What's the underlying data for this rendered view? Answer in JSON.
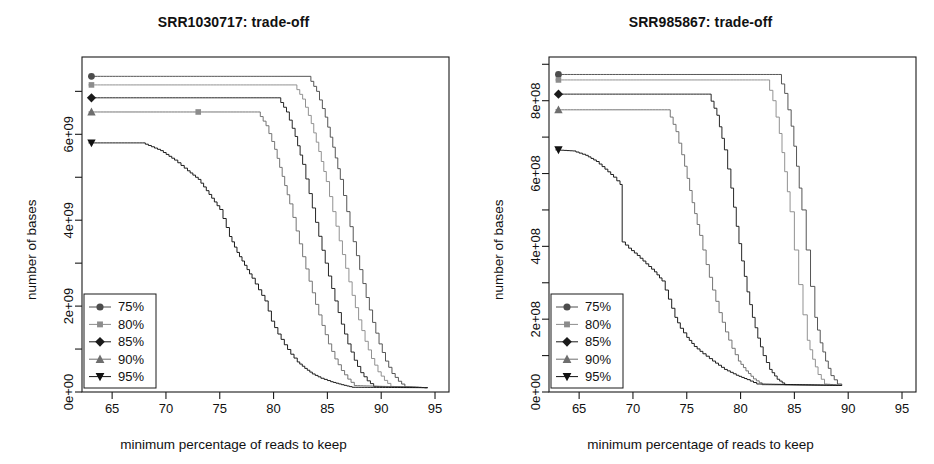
{
  "figure": {
    "width": 934,
    "height": 464,
    "background": "#ffffff",
    "line_color": "#3a3a3a",
    "axis_color": "#1a1a1a",
    "panel_count": 2
  },
  "axis_titles": {
    "x": "minimum percentage of reads to keep",
    "y": "number of bases"
  },
  "legend": {
    "entries": [
      {
        "label": "75%",
        "marker": "circle",
        "color": "#4d4d4d"
      },
      {
        "label": "80%",
        "marker": "square",
        "color": "#8c8c8c"
      },
      {
        "label": "85%",
        "marker": "diamond",
        "color": "#1a1a1a"
      },
      {
        "label": "90%",
        "marker": "triangle-up",
        "color": "#6e6e6e"
      },
      {
        "label": "95%",
        "marker": "triangle-down",
        "color": "#111111"
      }
    ]
  },
  "chart_data": [
    {
      "type": "line",
      "title": "SRR1030717: trade-off",
      "xlabel": "minimum percentage of reads to keep",
      "ylabel": "number of bases",
      "xlim": [
        62.2,
        96.3
      ],
      "ylim": [
        0,
        7800000000
      ],
      "xticks": [
        65,
        70,
        75,
        80,
        85,
        90,
        95
      ],
      "xtick_labels": [
        "65",
        "70",
        "75",
        "80",
        "85",
        "90",
        "95"
      ],
      "yticks": [
        0,
        2000000000,
        4000000000,
        6000000000
      ],
      "ytick_labels": [
        "0e+00",
        "2e+09",
        "4e+09",
        "6e+09"
      ],
      "yminor_ticks": [
        1000000000,
        3000000000,
        5000000000,
        7000000000
      ],
      "grid": false,
      "legend_position": "bottom-left",
      "series": [
        {
          "name": "75%",
          "marker": "circle",
          "color": "#4d4d4d",
          "x": [
            62.8,
            83.2,
            84.0,
            84.8,
            85.5,
            86.2,
            86.8,
            87.4,
            88.0,
            88.6,
            89.2,
            89.8,
            90.4,
            91.0,
            91.6,
            92.2,
            94.3
          ],
          "y": [
            7350000000,
            7350000000,
            7000000000,
            6400000000,
            5700000000,
            4950000000,
            4200000000,
            3500000000,
            2850000000,
            2200000000,
            1620000000,
            1120000000,
            720000000,
            430000000,
            250000000,
            120000000,
            100000000
          ]
        },
        {
          "name": "80%",
          "marker": "square",
          "color": "#8c8c8c",
          "x": [
            62.8,
            81.9,
            82.7,
            83.5,
            84.2,
            84.9,
            85.5,
            86.1,
            86.7,
            87.3,
            87.9,
            88.5,
            89.1,
            89.7,
            90.3,
            90.9,
            94.3
          ],
          "y": [
            7150000000,
            7150000000,
            6820000000,
            6250000000,
            5600000000,
            4900000000,
            4200000000,
            3520000000,
            2880000000,
            2250000000,
            1680000000,
            1180000000,
            780000000,
            470000000,
            270000000,
            130000000,
            100000000
          ]
        },
        {
          "name": "85%",
          "marker": "diamond",
          "color": "#1a1a1a",
          "x": [
            62.8,
            80.4,
            81.2,
            82.0,
            82.7,
            83.3,
            83.9,
            84.5,
            85.1,
            85.7,
            86.3,
            86.9,
            87.5,
            88.1,
            88.7,
            89.3,
            94.3
          ],
          "y": [
            6850000000,
            6850000000,
            6520000000,
            5950000000,
            5300000000,
            4620000000,
            3950000000,
            3300000000,
            2700000000,
            2120000000,
            1580000000,
            1120000000,
            740000000,
            450000000,
            260000000,
            130000000,
            100000000
          ]
        },
        {
          "name": "90%",
          "marker": "triangle-up",
          "color": "#6e6e6e",
          "x": [
            62.8,
            73.0,
            78.5,
            79.3,
            80.1,
            80.8,
            81.5,
            82.1,
            82.7,
            83.3,
            83.9,
            84.5,
            85.1,
            85.7,
            86.3,
            86.9,
            87.5,
            94.3
          ],
          "y": [
            6520000000,
            6520000000,
            6520000000,
            6200000000,
            5650000000,
            5020000000,
            4380000000,
            3750000000,
            3150000000,
            2580000000,
            2040000000,
            1550000000,
            1120000000,
            770000000,
            500000000,
            300000000,
            150000000,
            100000000
          ]
        },
        {
          "name": "95%",
          "marker": "triangle-down",
          "color": "#111111",
          "x": [
            62.8,
            67.8,
            69.5,
            70.8,
            72.0,
            73.0,
            74.0,
            75.0,
            75.9,
            76.6,
            77.3,
            78.0,
            78.6,
            79.2,
            79.8,
            80.4,
            81.0,
            81.6,
            82.2,
            82.9,
            83.6,
            84.4,
            85.3,
            86.3,
            87.3,
            94.3
          ],
          "y": [
            5800000000,
            5800000000,
            5620000000,
            5400000000,
            5150000000,
            4950000000,
            4600000000,
            4250000000,
            3620000000,
            3250000000,
            2950000000,
            2650000000,
            2380000000,
            2120000000,
            1650000000,
            1350000000,
            1100000000,
            880000000,
            700000000,
            550000000,
            420000000,
            320000000,
            240000000,
            170000000,
            110000000,
            100000000
          ]
        }
      ]
    },
    {
      "type": "line",
      "title": "SRR985867: trade-off",
      "xlabel": "minimum percentage of reads to keep",
      "ylabel": "number of bases",
      "xlim": [
        62.2,
        96.3
      ],
      "ylim": [
        0,
        920000000
      ],
      "xticks": [
        65,
        70,
        75,
        80,
        85,
        90,
        95
      ],
      "xtick_labels": [
        "65",
        "70",
        "75",
        "80",
        "85",
        "90",
        "95"
      ],
      "yticks": [
        0,
        200000000,
        400000000,
        600000000,
        800000000
      ],
      "ytick_labels": [
        "0e+00",
        "2e+08",
        "4e+08",
        "6e+08",
        "8e+08"
      ],
      "yminor_ticks": [
        100000000,
        300000000,
        500000000,
        700000000,
        900000000
      ],
      "grid": false,
      "legend_position": "bottom-left",
      "series": [
        {
          "name": "75%",
          "marker": "circle",
          "color": "#4d4d4d",
          "x": [
            62.8,
            83.5,
            84.1,
            84.7,
            85.2,
            85.7,
            86.1,
            86.5,
            86.9,
            87.4,
            87.9,
            88.4,
            89.0,
            89.4
          ],
          "y": [
            872000000,
            872000000,
            820000000,
            730000000,
            620000000,
            500000000,
            390000000,
            290000000,
            205000000,
            135000000,
            85000000,
            45000000,
            22000000,
            18000000
          ]
        },
        {
          "name": "80%",
          "marker": "square",
          "color": "#8c8c8c",
          "x": [
            62.8,
            82.4,
            83.0,
            83.6,
            84.1,
            84.6,
            85.0,
            85.4,
            85.8,
            86.2,
            86.7,
            87.2,
            87.8,
            89.4
          ],
          "y": [
            857000000,
            857000000,
            800000000,
            710000000,
            605000000,
            495000000,
            390000000,
            295000000,
            212000000,
            142000000,
            90000000,
            48000000,
            22000000,
            18000000
          ]
        },
        {
          "name": "85%",
          "marker": "diamond",
          "color": "#1a1a1a",
          "x": [
            62.8,
            77.0,
            77.8,
            78.5,
            79.1,
            79.6,
            80.1,
            80.6,
            81.1,
            81.6,
            82.1,
            82.7,
            83.4,
            84.1,
            89.4
          ],
          "y": [
            818000000,
            818000000,
            760000000,
            665000000,
            560000000,
            455000000,
            360000000,
            275000000,
            205000000,
            148000000,
            100000000,
            62000000,
            35000000,
            20000000,
            18000000
          ]
        },
        {
          "name": "90%",
          "marker": "triangle-up",
          "color": "#6e6e6e",
          "x": [
            62.8,
            73.2,
            74.0,
            74.8,
            75.5,
            76.2,
            76.8,
            77.4,
            78.0,
            78.6,
            79.2,
            79.8,
            80.5,
            81.2,
            82.0,
            89.4
          ],
          "y": [
            775000000,
            775000000,
            715000000,
            620000000,
            520000000,
            430000000,
            350000000,
            280000000,
            218000000,
            165000000,
            120000000,
            85000000,
            58000000,
            36000000,
            20000000,
            18000000
          ]
        },
        {
          "name": "95%",
          "marker": "triangle-down",
          "color": "#111111",
          "x": [
            62.8,
            64.4,
            65.6,
            66.6,
            67.4,
            68.2,
            68.8,
            69.0,
            69.6,
            70.4,
            71.2,
            72.0,
            72.7,
            73.3,
            73.9,
            74.4,
            75.0,
            75.7,
            76.5,
            77.4,
            78.5,
            79.6,
            80.6,
            81.5,
            89.4
          ],
          "y": [
            665000000,
            662000000,
            650000000,
            633000000,
            612000000,
            590000000,
            570000000,
            412000000,
            395000000,
            375000000,
            352000000,
            330000000,
            305000000,
            255000000,
            205000000,
            175000000,
            150000000,
            125000000,
            105000000,
            85000000,
            62000000,
            46000000,
            34000000,
            22000000,
            18000000
          ]
        }
      ]
    }
  ]
}
